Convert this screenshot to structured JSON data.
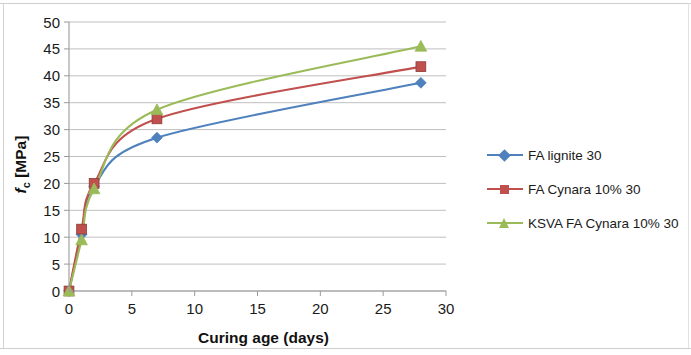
{
  "chart_data": {
    "type": "line",
    "title": "",
    "xlabel": "Curing age (days)",
    "ylabel": "fc [MPa]",
    "ylabel_parts": {
      "symbol": "f",
      "subscript": "c",
      "unit": "[MPa]"
    },
    "x": [
      0,
      1,
      2,
      7,
      28
    ],
    "xlim": [
      0,
      30
    ],
    "ylim": [
      0,
      50
    ],
    "xticks": [
      0,
      5,
      10,
      15,
      20,
      25,
      30
    ],
    "yticks": [
      0,
      5,
      10,
      15,
      20,
      25,
      30,
      35,
      40,
      45,
      50
    ],
    "grid": "horizontal",
    "legend_position": "right",
    "series": [
      {
        "name": "FA lignite 30",
        "color": "#4f81bd",
        "marker": "diamond",
        "values": [
          0,
          10.5,
          19.5,
          28.5,
          38.7
        ]
      },
      {
        "name": "FA  Cynara 10% 30",
        "color": "#c0504d",
        "marker": "square",
        "values": [
          0,
          11.5,
          20.0,
          32.0,
          41.7
        ]
      },
      {
        "name": "KSVA FA  Cynara 10% 30",
        "color": "#9bbb59",
        "marker": "triangle",
        "values": [
          0,
          9.5,
          19.0,
          33.7,
          45.5
        ]
      }
    ]
  },
  "axes": {
    "x_tick_labels": [
      "0",
      "5",
      "10",
      "15",
      "20",
      "25",
      "30"
    ],
    "y_tick_labels": [
      "0",
      "5",
      "10",
      "15",
      "20",
      "25",
      "30",
      "35",
      "40",
      "45",
      "50"
    ],
    "x_title": "Curing age (days)",
    "y_title_symbol": "f",
    "y_title_sub": "c",
    "y_title_unit": "[MPa]"
  },
  "legend": {
    "items": [
      {
        "label": "FA lignite 30",
        "color": "#4f81bd",
        "marker": "diamond"
      },
      {
        "label": "FA  Cynara 10% 30",
        "color": "#c0504d",
        "marker": "square"
      },
      {
        "label": "KSVA FA  Cynara 10% 30",
        "color": "#9bbb59",
        "marker": "triangle"
      }
    ]
  },
  "colors": {
    "series_blue": "#4f81bd",
    "series_red": "#c0504d",
    "series_green": "#9bbb59",
    "gridline": "#b8b8b8",
    "axis": "#9a9a9a",
    "text": "#1a1a1a"
  }
}
